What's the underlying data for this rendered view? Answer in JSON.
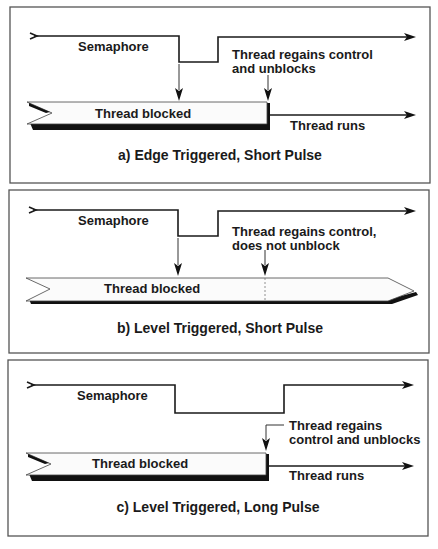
{
  "panels": [
    {
      "id": "a",
      "semaphore_label": "Semaphore",
      "event_label_line1": "Thread regains control",
      "event_label_line2": "and unblocks",
      "bar_label": "Thread blocked",
      "runs_label": "Thread runs",
      "caption": "a) Edge Triggered, Short Pulse"
    },
    {
      "id": "b",
      "semaphore_label": "Semaphore",
      "event_label_line1": "Thread regains control,",
      "event_label_line2": "does not unblock",
      "bar_label": "Thread blocked",
      "caption": "b) Level Triggered, Short Pulse"
    },
    {
      "id": "c",
      "semaphore_label": "Semaphore",
      "event_label_line1": "Thread regains",
      "event_label_line2": "control and unblocks",
      "bar_label": "Thread blocked",
      "runs_label": "Thread runs",
      "caption": "c) Level Triggered, Long Pulse"
    }
  ]
}
